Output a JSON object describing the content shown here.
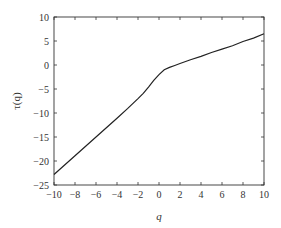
{
  "chart_data": {
    "type": "line",
    "title": "",
    "xlabel": "q",
    "ylabel": "τ(q)",
    "xlim": [
      -10,
      10
    ],
    "ylim": [
      -25,
      10
    ],
    "grid": false,
    "legend": null,
    "xticks": [
      -10,
      -8,
      -6,
      -4,
      -2,
      0,
      2,
      4,
      6,
      8,
      10
    ],
    "yticks": [
      -25,
      -20,
      -15,
      -10,
      -5,
      0,
      5,
      10
    ],
    "xtick_labels": [
      "−10",
      "−8",
      "−6",
      "−4",
      "−2",
      "0",
      "2",
      "4",
      "6",
      "8",
      "10"
    ],
    "ytick_labels": [
      "−25",
      "−20",
      "−15",
      "−10",
      "−5",
      "0",
      "5",
      "10"
    ],
    "series": [
      {
        "name": "τ(q)",
        "color": "#222222",
        "x": [
          -10,
          -8,
          -6,
          -4,
          -3,
          -2,
          -1.5,
          -1,
          -0.5,
          0,
          0.5,
          1,
          1.5,
          2,
          3,
          4,
          5,
          6,
          7,
          8,
          9,
          10
        ],
        "y": [
          -22.8,
          -18.9,
          -15.0,
          -11.1,
          -9.1,
          -7.0,
          -5.9,
          -4.6,
          -3.2,
          -2.0,
          -1.0,
          -0.5,
          -0.1,
          0.3,
          1.1,
          1.8,
          2.6,
          3.3,
          4.0,
          4.9,
          5.6,
          6.5
        ]
      }
    ]
  }
}
